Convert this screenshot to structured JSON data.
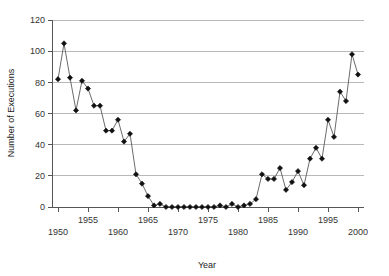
{
  "chart_data": {
    "type": "line",
    "title": "",
    "xlabel": "Year",
    "ylabel": "Number of Executions",
    "xlim": [
      1949,
      2001
    ],
    "ylim": [
      0,
      120
    ],
    "grid": true,
    "legend": "none",
    "marker": "diamond",
    "y_ticks": [
      0,
      20,
      40,
      60,
      80,
      100,
      120
    ],
    "y_tick_labels": [
      "0",
      "20",
      "40",
      "60",
      "80",
      "100",
      "120"
    ],
    "x_ticks": [
      1950,
      1955,
      1960,
      1965,
      1970,
      1975,
      1980,
      1985,
      1990,
      1995,
      2000
    ],
    "x_tick_labels": [
      "1950",
      "1955",
      "1960",
      "1965",
      "1970",
      "1975",
      "1980",
      "1985",
      "1990",
      "1995",
      "2000"
    ],
    "x_tick_labels_upper_row": [
      "1955",
      "1965",
      "1975",
      "1985",
      "1995"
    ],
    "x_tick_labels_lower_row": [
      "1950",
      "1960",
      "1970",
      "1980",
      "1990",
      "2000"
    ],
    "x": [
      1950,
      1951,
      1952,
      1953,
      1954,
      1955,
      1956,
      1957,
      1958,
      1959,
      1960,
      1961,
      1962,
      1963,
      1964,
      1965,
      1966,
      1967,
      1968,
      1969,
      1970,
      1971,
      1972,
      1973,
      1974,
      1975,
      1976,
      1977,
      1978,
      1979,
      1980,
      1981,
      1982,
      1983,
      1984,
      1985,
      1986,
      1987,
      1988,
      1989,
      1990,
      1991,
      1992,
      1993,
      1994,
      1995,
      1996,
      1997,
      1998,
      1999,
      2000
    ],
    "values": [
      82,
      105,
      83,
      62,
      81,
      76,
      65,
      65,
      49,
      49,
      56,
      42,
      47,
      21,
      15,
      7,
      1,
      2,
      0,
      0,
      0,
      0,
      0,
      0,
      0,
      0,
      0,
      1,
      0,
      2,
      0,
      1,
      2,
      5,
      21,
      18,
      18,
      25,
      11,
      16,
      23,
      14,
      31,
      38,
      31,
      56,
      45,
      74,
      68,
      98,
      85
    ],
    "series": [
      {
        "name": "Executions",
        "color": "#111111",
        "values": [
          82,
          105,
          83,
          62,
          81,
          76,
          65,
          65,
          49,
          49,
          56,
          42,
          47,
          21,
          15,
          7,
          1,
          2,
          0,
          0,
          0,
          0,
          0,
          0,
          0,
          0,
          0,
          1,
          0,
          2,
          0,
          1,
          2,
          5,
          21,
          18,
          18,
          25,
          11,
          16,
          23,
          14,
          31,
          38,
          31,
          56,
          45,
          74,
          68,
          98,
          85
        ]
      }
    ]
  }
}
